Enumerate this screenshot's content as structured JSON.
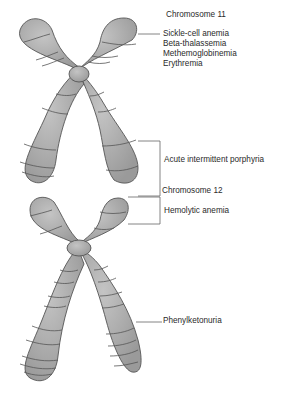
{
  "diagram": {
    "chromosomes": [
      {
        "title": "Chromosome 11",
        "diseases": [
          "Sickle-cell anemia",
          "Beta-thalassemia",
          "Methemoglobinemia",
          "Erythremia"
        ],
        "bracket_disease": "Acute intermittent porphyria"
      },
      {
        "title": "Chromosome 12",
        "bracket_disease": "Hemolytic anemia",
        "line_disease": "Phenylketonuria"
      }
    ],
    "colors": {
      "chromosome_fill": "#a8a8a8",
      "chromosome_stroke": "#555555",
      "band_stroke": "#555555",
      "leader_line": "#666666",
      "text": "#2a2a2a"
    }
  }
}
